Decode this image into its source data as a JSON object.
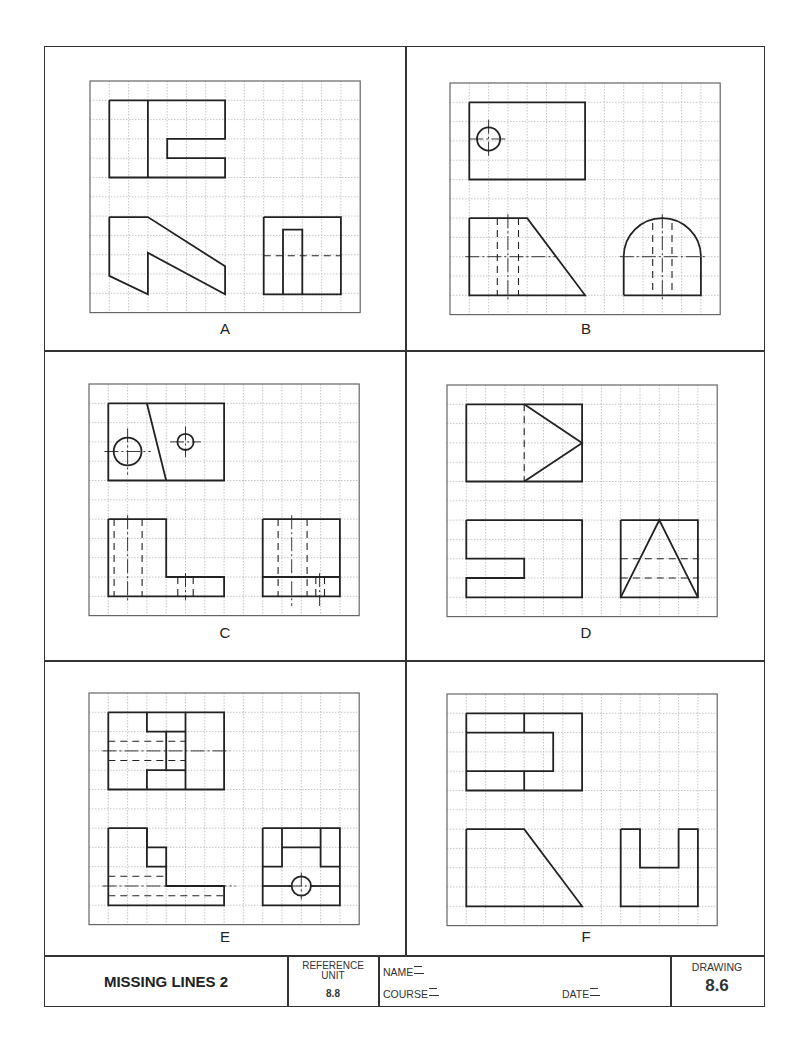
{
  "sheet": {
    "grid": {
      "cols": 14,
      "rows": 12,
      "cell_px": 19.3
    },
    "colors": {
      "ink": "#222222",
      "grid_line": "#b8b8b8",
      "frame": "#333333"
    }
  },
  "panels": [
    {
      "id": "A",
      "label": "A",
      "origin": [
        90,
        81
      ],
      "polylines": [
        [
          [
            1,
            1
          ],
          [
            7,
            1
          ],
          [
            7,
            3
          ],
          [
            4,
            3
          ],
          [
            4,
            4
          ],
          [
            7,
            4
          ],
          [
            7,
            5
          ],
          [
            1,
            5
          ],
          [
            1,
            1
          ]
        ],
        [
          [
            3,
            1
          ],
          [
            3,
            5
          ]
        ],
        [
          [
            1,
            7.05
          ],
          [
            3,
            7.05
          ],
          [
            7,
            9.6
          ],
          [
            7,
            11.05
          ],
          [
            3,
            8.9
          ],
          [
            3,
            11.05
          ],
          [
            1,
            10.1
          ],
          [
            1,
            7.05
          ]
        ],
        [
          [
            9,
            7.05
          ],
          [
            13,
            7.05
          ],
          [
            13,
            11.05
          ],
          [
            9,
            11.05
          ],
          [
            9,
            7.05
          ]
        ],
        [
          [
            10,
            11.05
          ],
          [
            10,
            7.7
          ],
          [
            11,
            7.7
          ],
          [
            11,
            11.05
          ]
        ]
      ],
      "dashed": [
        [
          [
            9,
            9.05
          ],
          [
            13,
            9.05
          ]
        ]
      ],
      "center": [],
      "circles": []
    },
    {
      "id": "B",
      "label": "B",
      "origin": [
        450,
        83
      ],
      "polylines": [
        [
          [
            1,
            1
          ],
          [
            7,
            1
          ],
          [
            7,
            5
          ],
          [
            1,
            5
          ],
          [
            1,
            1
          ]
        ],
        [
          [
            1,
            7
          ],
          [
            4,
            7
          ],
          [
            7,
            11
          ],
          [
            1,
            11
          ],
          [
            1,
            7
          ]
        ],
        [
          [
            9,
            11
          ],
          [
            9,
            9
          ]
        ],
        [
          [
            13,
            9
          ],
          [
            13,
            11
          ],
          [
            9,
            11
          ]
        ]
      ],
      "arcs": [
        {
          "c": [
            11,
            9
          ],
          "r": 2
        }
      ],
      "dashed": [
        [
          [
            2.45,
            7
          ],
          [
            2.45,
            11
          ]
        ],
        [
          [
            3.55,
            7
          ],
          [
            3.55,
            11
          ]
        ],
        [
          [
            10.5,
            7.25
          ],
          [
            10.5,
            11
          ]
        ],
        [
          [
            11.5,
            7.25
          ],
          [
            11.5,
            11
          ]
        ]
      ],
      "center": [
        [
          [
            1.0,
            2.9
          ],
          [
            3.0,
            2.9
          ]
        ],
        [
          [
            2,
            1.9
          ],
          [
            2,
            3.9
          ]
        ],
        [
          [
            0.8,
            9
          ],
          [
            5.5,
            9
          ]
        ],
        [
          [
            3,
            6.8
          ],
          [
            3,
            11.2
          ]
        ],
        [
          [
            8.8,
            9
          ],
          [
            13.2,
            9
          ]
        ],
        [
          [
            11,
            6.8
          ],
          [
            11,
            11.2
          ]
        ]
      ],
      "circles": [
        {
          "c": [
            2,
            2.9
          ],
          "r": 0.6
        }
      ]
    },
    {
      "id": "C",
      "label": "C",
      "origin": [
        89,
        384
      ],
      "polylines": [
        [
          [
            1,
            1
          ],
          [
            7,
            1
          ],
          [
            7,
            5
          ],
          [
            1,
            5
          ],
          [
            1,
            1
          ]
        ],
        [
          [
            3,
            1
          ],
          [
            4,
            5
          ]
        ],
        [
          [
            1,
            7
          ],
          [
            4,
            7
          ],
          [
            4,
            10
          ],
          [
            7,
            10
          ],
          [
            7,
            11
          ],
          [
            1,
            11
          ],
          [
            1,
            7
          ]
        ],
        [
          [
            9,
            7
          ],
          [
            13,
            7
          ],
          [
            13,
            11
          ],
          [
            9,
            11
          ],
          [
            9,
            7
          ]
        ],
        [
          [
            9,
            10
          ],
          [
            13,
            10
          ]
        ]
      ],
      "dashed": [
        [
          [
            1.3,
            7
          ],
          [
            1.3,
            11
          ]
        ],
        [
          [
            2.75,
            7
          ],
          [
            2.75,
            11
          ]
        ],
        [
          [
            4.6,
            10
          ],
          [
            4.6,
            11
          ]
        ],
        [
          [
            5.4,
            10
          ],
          [
            5.4,
            11
          ]
        ],
        [
          [
            9.8,
            7
          ],
          [
            9.8,
            11
          ]
        ],
        [
          [
            11.3,
            7
          ],
          [
            11.3,
            11
          ]
        ],
        [
          [
            11.75,
            10
          ],
          [
            11.75,
            11
          ]
        ],
        [
          [
            12.2,
            10
          ],
          [
            12.2,
            11
          ]
        ]
      ],
      "center": [
        [
          [
            0.8,
            3.5
          ],
          [
            3.2,
            3.5
          ]
        ],
        [
          [
            2,
            2.3
          ],
          [
            2,
            4.7
          ]
        ],
        [
          [
            4.2,
            3
          ],
          [
            5.8,
            3
          ]
        ],
        [
          [
            5,
            2.2
          ],
          [
            5,
            3.8
          ]
        ],
        [
          [
            2,
            6.8
          ],
          [
            2,
            11.2
          ]
        ],
        [
          [
            5,
            9.8
          ],
          [
            5,
            11.2
          ]
        ],
        [
          [
            10.5,
            6.8
          ],
          [
            10.5,
            11.5
          ]
        ],
        [
          [
            11.95,
            9.8
          ],
          [
            11.95,
            11.5
          ]
        ]
      ],
      "circles": [
        {
          "c": [
            2,
            3.5
          ],
          "r": 0.72
        },
        {
          "c": [
            5,
            3
          ],
          "r": 0.42
        }
      ]
    },
    {
      "id": "D",
      "label": "D",
      "origin": [
        447,
        385
      ],
      "polylines": [
        [
          [
            1,
            1
          ],
          [
            7,
            1
          ],
          [
            7,
            5
          ],
          [
            1,
            5
          ],
          [
            1,
            1
          ]
        ],
        [
          [
            4,
            1
          ],
          [
            7,
            3
          ],
          [
            4,
            5
          ]
        ],
        [
          [
            1,
            7
          ],
          [
            7,
            7
          ],
          [
            7,
            11
          ],
          [
            1,
            11
          ],
          [
            1,
            10
          ],
          [
            4,
            10
          ],
          [
            4,
            9
          ],
          [
            1,
            9
          ],
          [
            1,
            7
          ]
        ],
        [
          [
            9,
            7
          ],
          [
            13,
            7
          ],
          [
            13,
            11
          ],
          [
            9,
            11
          ],
          [
            9,
            7
          ]
        ],
        [
          [
            9,
            11
          ],
          [
            11,
            7
          ],
          [
            13,
            11
          ]
        ]
      ],
      "dashed": [
        [
          [
            4,
            1
          ],
          [
            4,
            5
          ]
        ],
        [
          [
            9,
            9
          ],
          [
            13,
            9
          ]
        ],
        [
          [
            9,
            10
          ],
          [
            13,
            10
          ]
        ]
      ],
      "center": [],
      "circles": []
    },
    {
      "id": "E",
      "label": "E",
      "origin": [
        89,
        693
      ],
      "polylines": [
        [
          [
            1,
            1
          ],
          [
            7,
            1
          ],
          [
            7,
            5
          ],
          [
            1,
            5
          ],
          [
            1,
            1
          ]
        ],
        [
          [
            3,
            1
          ],
          [
            3,
            2
          ],
          [
            4,
            2
          ],
          [
            4,
            4
          ],
          [
            3,
            4
          ],
          [
            3,
            5
          ]
        ],
        [
          [
            4,
            2
          ],
          [
            5,
            2
          ]
        ],
        [
          [
            4,
            4
          ],
          [
            5,
            4
          ]
        ],
        [
          [
            5,
            1
          ],
          [
            5,
            5
          ]
        ],
        [
          [
            1,
            7
          ],
          [
            3,
            7
          ],
          [
            3,
            8
          ],
          [
            4,
            8
          ],
          [
            4,
            10
          ],
          [
            7,
            10
          ],
          [
            7,
            11
          ],
          [
            1,
            11
          ],
          [
            1,
            7
          ]
        ],
        [
          [
            3,
            7
          ],
          [
            3,
            9
          ],
          [
            4,
            9
          ]
        ],
        [
          [
            9,
            7
          ],
          [
            13,
            7
          ],
          [
            13,
            11
          ],
          [
            9,
            11
          ],
          [
            9,
            7
          ]
        ],
        [
          [
            10,
            7
          ],
          [
            10,
            9
          ],
          [
            9,
            9
          ]
        ],
        [
          [
            10,
            8
          ],
          [
            12,
            8
          ]
        ],
        [
          [
            12,
            7
          ],
          [
            12,
            9
          ],
          [
            13,
            9
          ]
        ],
        [
          [
            9,
            10
          ],
          [
            10.5,
            10
          ]
        ],
        [
          [
            11.5,
            10
          ],
          [
            13,
            10
          ]
        ]
      ],
      "dashed": [
        [
          [
            1,
            2.5
          ],
          [
            5,
            2.5
          ]
        ],
        [
          [
            1,
            3.5
          ],
          [
            5,
            3.5
          ]
        ],
        [
          [
            1,
            9.5
          ],
          [
            4,
            9.5
          ]
        ],
        [
          [
            1,
            10.5
          ],
          [
            7,
            10.5
          ]
        ]
      ],
      "center": [
        [
          [
            0.7,
            3
          ],
          [
            7.3,
            3
          ]
        ],
        [
          [
            0.7,
            10
          ],
          [
            7.6,
            10
          ]
        ],
        [
          [
            11,
            9.3
          ],
          [
            11,
            10.7
          ]
        ],
        [
          [
            10.3,
            10
          ],
          [
            11.7,
            10
          ]
        ]
      ],
      "circles": [
        {
          "c": [
            11,
            10
          ],
          "r": 0.5
        }
      ]
    },
    {
      "id": "F",
      "label": "F",
      "origin": [
        447,
        694
      ],
      "polylines": [
        [
          [
            1,
            1
          ],
          [
            7,
            1
          ],
          [
            7,
            5
          ],
          [
            1,
            5
          ],
          [
            1,
            1
          ]
        ],
        [
          [
            1,
            2
          ],
          [
            5.5,
            2
          ],
          [
            5.5,
            4
          ],
          [
            1,
            4
          ]
        ],
        [
          [
            4,
            1
          ],
          [
            4,
            2
          ]
        ],
        [
          [
            4,
            4
          ],
          [
            4,
            5
          ]
        ],
        [
          [
            1,
            7
          ],
          [
            4,
            7
          ],
          [
            7,
            11
          ],
          [
            1,
            11
          ],
          [
            1,
            7
          ]
        ],
        [
          [
            9,
            7
          ],
          [
            10,
            7
          ],
          [
            10,
            9
          ],
          [
            12,
            9
          ],
          [
            12,
            7
          ],
          [
            13,
            7
          ],
          [
            13,
            11
          ],
          [
            9,
            11
          ],
          [
            9,
            7
          ]
        ]
      ],
      "dashed": [],
      "center": [],
      "circles": []
    }
  ],
  "title_block": {
    "title": "MISSING LINES 2",
    "reference_label_1": "REFERENCE",
    "reference_label_2": "UNIT",
    "reference_value": "8.8",
    "name_label": "NAME",
    "course_label": "COURSE",
    "date_label": "DATE",
    "drawing_label": "DRAWING",
    "drawing_value": "8.6"
  }
}
